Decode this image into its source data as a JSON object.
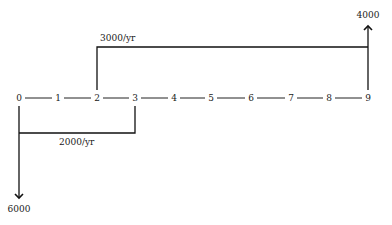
{
  "diagram": {
    "type": "cash-flow-diagram",
    "timeline": {
      "periods": [
        "0",
        "1",
        "2",
        "3",
        "4",
        "5",
        "6",
        "7",
        "8",
        "9"
      ]
    },
    "flows": {
      "income_series": {
        "label": "3000/yr",
        "from_period": "2",
        "to_period": "9",
        "direction": "up"
      },
      "expense_series": {
        "label": "2000/yr",
        "from_period": "0",
        "to_period": "3",
        "direction": "down"
      },
      "final_receipt": {
        "label": "4000",
        "period": "9",
        "direction": "up"
      },
      "initial_payment": {
        "label": "6000",
        "period": "0",
        "direction": "down"
      }
    }
  }
}
